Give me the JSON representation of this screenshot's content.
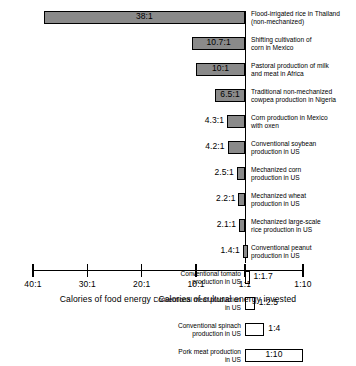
{
  "chart_data": {
    "type": "bar",
    "orientation": "horizontal",
    "title": "",
    "subtitle": "",
    "xlabel": "Calories of food energy : Calories of cultural energy invested",
    "ylabel": "",
    "grid": false,
    "legend": null,
    "axis": {
      "tick_labels": [
        "40:1",
        "30:1",
        "20:1",
        "10:1",
        "1:1",
        "1:10"
      ],
      "tick_values": [
        40,
        30,
        20,
        10,
        1,
        -10
      ],
      "baseline_label": "1:1",
      "xlim_left_label": "40:1",
      "xlim_right_label": "1:10"
    },
    "categories": [
      "Flood-irrigated rice in Thailand\n(non-mechanized)",
      "Shifting cultivation of\ncorn in Mexico",
      "Pastoral production of milk\nand meat in Africa",
      "Traditional non-mechanized\ncowpea production in Nigeria",
      "Corn production in Mexico\nwith oxen",
      "Conventional soybean\nproduction in US",
      "Mechanized corn\nproduction in US",
      "Mechanized wheat\nproduction in US",
      "Mechanized large-scale\nrice production in US",
      "Conventional peanut\nproduction in US",
      "Conventional tomato\nproduction in US",
      "Conventional meat production\nin US",
      "Conventional spinach\nproduction in US",
      "Pork meat production\nin US"
    ],
    "value_labels": [
      "38:1",
      "10.7:1",
      "10:1",
      "6.5:1",
      "4.3:1",
      "4.2:1",
      "2.5:1",
      "2.2:1",
      "2.1:1",
      "1.4:1",
      "1:1.7",
      "1:2.5",
      "1:4",
      "1:10"
    ],
    "values": [
      38,
      10.7,
      10,
      6.5,
      4.3,
      4.2,
      2.5,
      2.2,
      2.1,
      1.4,
      -1.7,
      -2.5,
      -4,
      -10
    ],
    "bars": [
      {
        "label": "38:1",
        "category": "Flood-irrigated rice in Thailand\n(non-mechanized)",
        "value": 38,
        "direction": "positive",
        "label_position": "inside",
        "category_side": "right",
        "fill": "#8a8a8a"
      },
      {
        "label": "10.7:1",
        "category": "Shifting cultivation of\ncorn in Mexico",
        "value": 10.7,
        "direction": "positive",
        "label_position": "inside",
        "category_side": "right",
        "fill": "#8a8a8a"
      },
      {
        "label": "10:1",
        "category": "Pastoral production of milk\nand meat in Africa",
        "value": 10,
        "direction": "positive",
        "label_position": "inside",
        "category_side": "right",
        "fill": "#8a8a8a"
      },
      {
        "label": "6.5:1",
        "category": "Traditional non-mechanized\ncowpea production in Nigeria",
        "value": 6.5,
        "direction": "positive",
        "label_position": "inside",
        "category_side": "right",
        "fill": "#8a8a8a"
      },
      {
        "label": "4.3:1",
        "category": "Corn production in Mexico\nwith oxen",
        "value": 4.3,
        "direction": "positive",
        "label_position": "outleft",
        "category_side": "right",
        "fill": "#8a8a8a"
      },
      {
        "label": "4.2:1",
        "category": "Conventional soybean\nproduction in US",
        "value": 4.2,
        "direction": "positive",
        "label_position": "outleft",
        "category_side": "right",
        "fill": "#8a8a8a"
      },
      {
        "label": "2.5:1",
        "category": "Mechanized corn\nproduction in US",
        "value": 2.5,
        "direction": "positive",
        "label_position": "outleft",
        "category_side": "right",
        "fill": "#8a8a8a"
      },
      {
        "label": "2.2:1",
        "category": "Mechanized wheat\nproduction in US",
        "value": 2.2,
        "direction": "positive",
        "label_position": "outleft",
        "category_side": "right",
        "fill": "#8a8a8a"
      },
      {
        "label": "2.1:1",
        "category": "Mechanized large-scale\nrice production in US",
        "value": 2.1,
        "direction": "positive",
        "label_position": "outleft",
        "category_side": "right",
        "fill": "#8a8a8a"
      },
      {
        "label": "1.4:1",
        "category": "Conventional peanut\nproduction in US",
        "value": 1.4,
        "direction": "positive",
        "label_position": "outleft",
        "category_side": "right",
        "fill": "#8a8a8a"
      },
      {
        "label": "1:1.7",
        "category": "Conventional tomato\nproduction in US",
        "value": -1.7,
        "direction": "negative",
        "label_position": "outright",
        "category_side": "left",
        "fill": "#ffffff"
      },
      {
        "label": "1:2.5",
        "category": "Conventional meat production\nin US",
        "value": -2.5,
        "direction": "negative",
        "label_position": "outright",
        "category_side": "left",
        "fill": "#ffffff"
      },
      {
        "label": "1:4",
        "category": "Conventional spinach\nproduction in US",
        "value": -4,
        "direction": "negative",
        "label_position": "outright",
        "category_side": "left",
        "fill": "#ffffff"
      },
      {
        "label": "1:10",
        "category": "Pork meat production\nin US",
        "value": -10,
        "direction": "negative",
        "label_position": "inside",
        "category_side": "left",
        "fill": "#ffffff"
      }
    ],
    "colors": {
      "positive_fill": "#8a8a8a",
      "negative_fill": "#ffffff",
      "bar_stroke": "#000000",
      "axis": "#000000",
      "text": "#000000",
      "background": "#ffffff"
    }
  }
}
